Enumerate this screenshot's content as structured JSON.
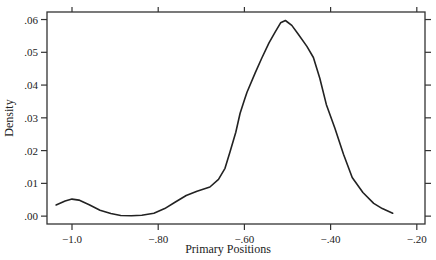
{
  "chart_data": {
    "type": "line",
    "title": "",
    "xlabel": "Primary Positions",
    "ylabel": "Density",
    "xlim": [
      -1.058,
      -0.181
    ],
    "ylim": [
      -0.0024,
      0.0623
    ],
    "grid": false,
    "legend": null,
    "x_ticks": [
      -1.0,
      -0.8,
      -0.6,
      -0.4,
      -0.2
    ],
    "x_tick_labels": [
      "-1.0",
      "-.80",
      "-.60",
      "-.40",
      "-.20"
    ],
    "y_ticks": [
      0.0,
      0.01,
      0.02,
      0.03,
      0.04,
      0.05,
      0.06
    ],
    "y_tick_labels": [
      ".00",
      ".01",
      ".02",
      ".03",
      ".04",
      ".05",
      ".06"
    ],
    "series": [
      {
        "name": "Density",
        "color": "#222222",
        "x": [
          -1.037,
          -1.016,
          -1.0,
          -0.984,
          -0.96,
          -0.935,
          -0.91,
          -0.887,
          -0.862,
          -0.838,
          -0.81,
          -0.785,
          -0.76,
          -0.735,
          -0.71,
          -0.68,
          -0.66,
          -0.645,
          -0.633,
          -0.62,
          -0.61,
          -0.6,
          -0.594,
          -0.575,
          -0.56,
          -0.543,
          -0.528,
          -0.516,
          -0.505,
          -0.49,
          -0.475,
          -0.455,
          -0.44,
          -0.425,
          -0.41,
          -0.39,
          -0.37,
          -0.35,
          -0.325,
          -0.3,
          -0.28,
          -0.256
        ],
        "y": [
          0.0034,
          0.0046,
          0.0052,
          0.0049,
          0.0035,
          0.0018,
          0.0008,
          0.0002,
          0.0001,
          0.0003,
          0.0009,
          0.0023,
          0.0043,
          0.0063,
          0.0076,
          0.0089,
          0.0112,
          0.0146,
          0.0198,
          0.0256,
          0.0314,
          0.0354,
          0.0378,
          0.0437,
          0.0481,
          0.0529,
          0.0563,
          0.059,
          0.0597,
          0.0582,
          0.0555,
          0.0518,
          0.0484,
          0.0421,
          0.0341,
          0.0268,
          0.0189,
          0.0118,
          0.0072,
          0.0039,
          0.0023,
          0.0009
        ]
      }
    ]
  },
  "plot": {
    "frame": {
      "left": 47,
      "top": 12,
      "right": 425,
      "bottom": 224
    },
    "line_color": "#222222",
    "axis_color": "#333333"
  }
}
